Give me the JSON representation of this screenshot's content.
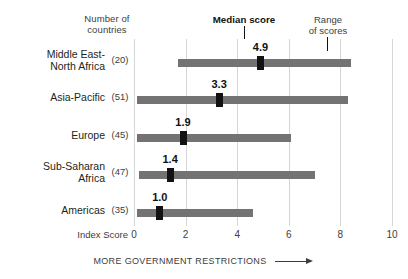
{
  "headers": {
    "number_of_countries": "Number of\ncountries",
    "median_score_legend": "Median score",
    "range_of_scores_legend": "Range\nof scores",
    "index_score_label": "Index Score"
  },
  "footer": {
    "note": "MORE GOVERNMENT RESTRICTIONS"
  },
  "colors": {
    "bar": "#737373",
    "median_marker": "#121212",
    "gridline": "#d6d6d6",
    "text": "#231f20"
  },
  "chart_data": {
    "type": "bar",
    "orientation": "horizontal",
    "subtype": "floating-range-bar-with-median-marker",
    "title": "",
    "xlabel": "Index Score",
    "ylabel": "",
    "xlim": [
      0,
      10
    ],
    "xticks": [
      0,
      2,
      4,
      6,
      8,
      10
    ],
    "xticklabels": [
      "0",
      "2",
      "4",
      "6",
      "8",
      "10"
    ],
    "grid": "vertical-at-ticks",
    "legend": [
      "Median score",
      "Range of scores"
    ],
    "legend_position": "top",
    "annotation": "MORE GOVERNMENT RESTRICTIONS",
    "categories": [
      "Middle East-North Africa",
      "Asia-Pacific",
      "Europe",
      "Sub-Saharan Africa",
      "Americas"
    ],
    "rows": [
      {
        "label_line1": "Middle East-",
        "label_line2": "North Africa",
        "countries": "(20)",
        "range_min": 1.7,
        "range_max": 8.4,
        "median": 4.9,
        "median_label": "4.9"
      },
      {
        "label_line1": "Asia-Pacific",
        "label_line2": "",
        "countries": "(51)",
        "range_min": 0.1,
        "range_max": 8.3,
        "median": 3.3,
        "median_label": "3.3"
      },
      {
        "label_line1": "Europe",
        "label_line2": "",
        "countries": "(45)",
        "range_min": 0.1,
        "range_max": 6.1,
        "median": 1.9,
        "median_label": "1.9"
      },
      {
        "label_line1": "Sub-Saharan",
        "label_line2": "Africa",
        "countries": "(47)",
        "range_min": 0.2,
        "range_max": 7.0,
        "median": 1.4,
        "median_label": "1.4"
      },
      {
        "label_line1": "Americas",
        "label_line2": "",
        "countries": "(35)",
        "range_min": 0.1,
        "range_max": 4.6,
        "median": 1.0,
        "median_label": "1.0"
      }
    ]
  }
}
